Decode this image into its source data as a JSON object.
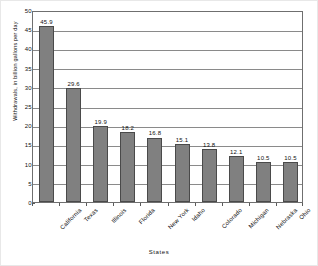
{
  "chart_data": {
    "type": "bar",
    "title": "",
    "subtitle": "",
    "xlabel": "States",
    "ylabel": "Withdrawals, in billion gallons per day",
    "categories": [
      "California",
      "Texas",
      "Illinois",
      "Florida",
      "New York",
      "Idaho",
      "Colorado",
      "Michigan",
      "Nebraska",
      "Ohio"
    ],
    "values": [
      45.9,
      29.6,
      19.9,
      18.2,
      16.8,
      15.1,
      13.8,
      12.1,
      10.5,
      10.5
    ],
    "value_labels": [
      "45.9",
      "29.6",
      "19.9",
      "18.2",
      "16.8",
      "15.1",
      "13.8",
      "12.1",
      "10.5",
      "10.5"
    ],
    "ylim": [
      0,
      50
    ],
    "y_ticks": [
      0,
      5,
      10,
      15,
      20,
      25,
      30,
      35,
      40,
      45,
      50
    ],
    "y_tick_labels": [
      "0",
      "5",
      "10",
      "15",
      "20",
      "25",
      "30",
      "35",
      "40",
      "45",
      "50"
    ],
    "grid": true,
    "legend": null,
    "legend_position": "none",
    "bar_color": "#808080",
    "bar_border_color": "#4a4a4a",
    "gridline_color": "#8a8a8a",
    "axis_color": "#6f6f6f",
    "background_color": "#ffffff"
  }
}
